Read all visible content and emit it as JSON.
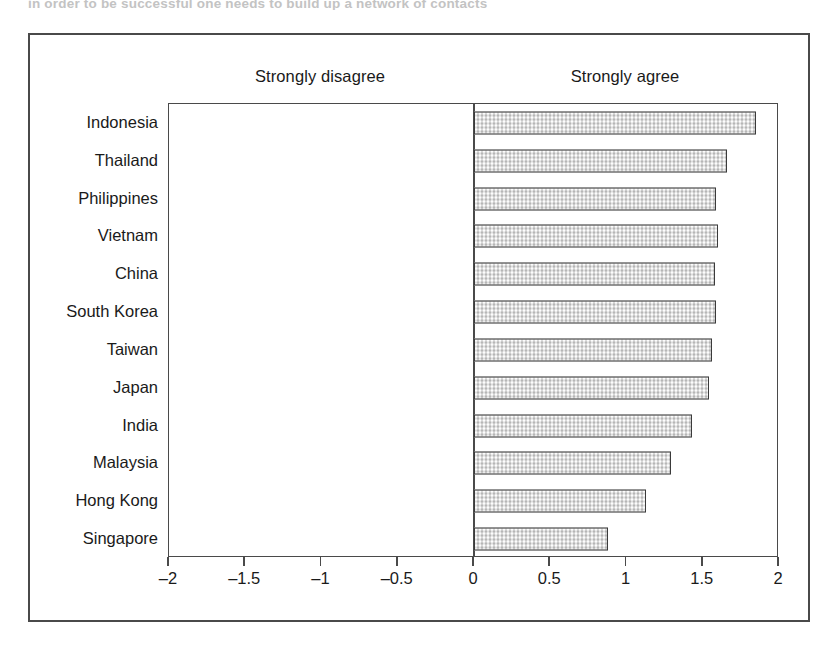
{
  "caption": {
    "cut_off_line": "in order to be successful one needs to build up a network of contacts"
  },
  "figure": {
    "anchor_left": "Strongly disagree",
    "anchor_right": "Strongly agree"
  },
  "chart_data": {
    "type": "bar",
    "orientation": "horizontal",
    "title": "",
    "subtitle": "",
    "xlabel": "",
    "ylabel": "",
    "xlim": [
      -2,
      2
    ],
    "xticks": [
      -2,
      -1.5,
      -1,
      -0.5,
      0,
      0.5,
      1,
      1.5,
      2
    ],
    "xticklabels": [
      "–2",
      "–1.5",
      "–1",
      "–0.5",
      "0",
      "0.5",
      "1",
      "1.5",
      "2"
    ],
    "grid": false,
    "legend": null,
    "annotations": [
      "Strongly disagree",
      "Strongly agree"
    ],
    "bar_fill_color": "#dcdcdc",
    "bar_edge_color": "#3a3a3a",
    "axis_color": "#4a4a4a",
    "categories": [
      "Indonesia",
      "Thailand",
      "Philippines",
      "Vietnam",
      "China",
      "South Korea",
      "Taiwan",
      "Japan",
      "India",
      "Malaysia",
      "Hong Kong",
      "Singapore"
    ],
    "values": [
      1.85,
      1.66,
      1.59,
      1.6,
      1.58,
      1.59,
      1.56,
      1.54,
      1.43,
      1.29,
      1.13,
      0.88
    ]
  }
}
